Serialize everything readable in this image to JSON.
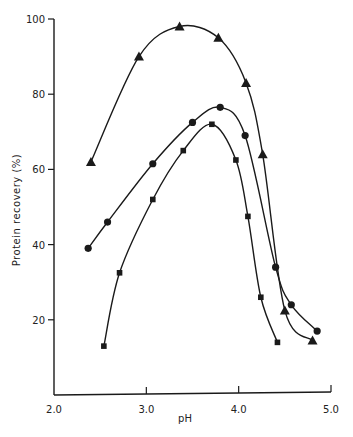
{
  "chart_data": {
    "type": "line",
    "title": "",
    "xlabel": "pH",
    "ylabel": "Protein recovery (%)",
    "xlim": [
      2.0,
      5.0
    ],
    "ylim": [
      0,
      100
    ],
    "xticks": [
      "2.0",
      "3.0",
      "4.0",
      "5.0"
    ],
    "yticks": [
      "20",
      "40",
      "60",
      "80",
      "100"
    ],
    "grid": false,
    "legend": "none",
    "series": [
      {
        "name": "triangle",
        "marker": "triangle",
        "x": [
          2.4,
          2.92,
          3.36,
          3.78,
          4.08,
          4.26,
          4.5,
          4.8
        ],
        "y": [
          62,
          90,
          98,
          95,
          83,
          64,
          22.5,
          14.5
        ]
      },
      {
        "name": "circle",
        "marker": "circle",
        "x": [
          2.37,
          2.58,
          3.07,
          3.5,
          3.8,
          4.07,
          4.4,
          4.57,
          4.85
        ],
        "y": [
          39,
          46,
          61.5,
          72.5,
          76.5,
          69,
          34,
          24,
          17
        ]
      },
      {
        "name": "square",
        "marker": "square",
        "x": [
          2.54,
          2.71,
          3.07,
          3.4,
          3.71,
          3.97,
          4.1,
          4.24,
          4.42
        ],
        "y": [
          13,
          32.5,
          52,
          65,
          72,
          62.5,
          47.5,
          26,
          14
        ]
      }
    ]
  }
}
